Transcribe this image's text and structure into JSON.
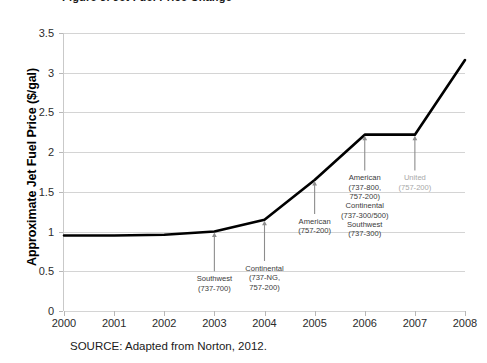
{
  "figure": {
    "title_fragment": "Figure 3. Jet Fuel Price Change",
    "source_note": "SOURCE: Adapted from Norton, 2012."
  },
  "chart_data": {
    "type": "line",
    "title": "",
    "xlabel": "",
    "ylabel": "Approximate Jet Fuel Price ($/gal)",
    "x": [
      2000,
      2001,
      2002,
      2003,
      2004,
      2005,
      2006,
      2007,
      2008
    ],
    "values": [
      0.95,
      0.95,
      0.96,
      1.0,
      1.15,
      1.65,
      2.22,
      2.22,
      3.16
    ],
    "series": [
      {
        "name": "Approximate Jet Fuel Price",
        "values": [
          0.95,
          0.95,
          0.96,
          1.0,
          1.15,
          1.65,
          2.22,
          2.22,
          3.16
        ],
        "color": "#000000"
      }
    ],
    "xtick_labels": [
      "2000",
      "2001",
      "2002",
      "2003",
      "2004",
      "2005",
      "2006",
      "2007",
      "2008"
    ],
    "ytick_labels": [
      "0",
      "0.5",
      "1",
      "1.5",
      "2",
      "2.5",
      "3",
      "3.5"
    ],
    "ytick_values": [
      0,
      0.5,
      1,
      1.5,
      2,
      2.5,
      3,
      3.5
    ],
    "xlim": [
      2000,
      2008
    ],
    "ylim": [
      0,
      3.5
    ],
    "grid": "horizontal",
    "legend": "none",
    "line_color": "#000000",
    "grid_color": "#d4d4d4",
    "annotation_color": "#3a3a3a",
    "annotation_muted_color": "#a8a8a8",
    "arrow_color": "#8c8c8c",
    "annotations": [
      {
        "id": "southwest-737-700",
        "label": "Southwest\n(737-700)",
        "x": 2003,
        "y": 1.0,
        "arrow_from_y": 0.5,
        "muted": false
      },
      {
        "id": "continental-737ng-757-200",
        "label": "Continental\n(737-NG,\n757-200)",
        "x": 2004,
        "y": 1.15,
        "arrow_from_y": 0.63,
        "muted": false
      },
      {
        "id": "american-757-200",
        "label": "American\n(757-200)",
        "x": 2005,
        "y": 1.65,
        "arrow_from_y": 1.22,
        "muted": false
      },
      {
        "id": "american-continental-southwest-2006",
        "label": "American\n(737-800,\n757-200)\nContinental\n(737-300/500)\nSouthwest\n(737-300)",
        "x": 2006,
        "y": 2.22,
        "arrow_from_y": 1.77,
        "muted": false
      },
      {
        "id": "united-757-200",
        "label": "United\n(757-200)",
        "x": 2007,
        "y": 2.22,
        "arrow_from_y": 1.77,
        "muted": true
      }
    ]
  }
}
